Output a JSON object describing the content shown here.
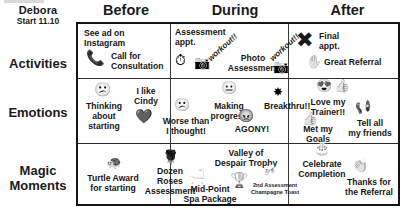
{
  "persona": {
    "name": "Debora",
    "start": "Start 11.10"
  },
  "columns": [
    {
      "id": "before",
      "label": "Before"
    },
    {
      "id": "during",
      "label": "During"
    },
    {
      "id": "after",
      "label": "After"
    }
  ],
  "rows": [
    {
      "id": "activities",
      "label": "Activities"
    },
    {
      "id": "emotions",
      "label": "Emotions"
    },
    {
      "id": "magic",
      "label": "Magic\nMoments"
    }
  ],
  "cells": {
    "activities_before": [
      {
        "text": "See ad on\nInstagram",
        "icon": ""
      },
      {
        "text": "Call for\nConsultation",
        "icon": "phone-icon"
      }
    ],
    "activities_during": [
      {
        "text": "Assessment\nappt.",
        "icon": "stopwatch-icon"
      },
      {
        "text": "workout!!",
        "icon": "camera-icon"
      },
      {
        "text": "Photo\nAssessment",
        "icon": ""
      },
      {
        "text": "workout!!",
        "icon": "camera-icon"
      }
    ],
    "activities_after": [
      {
        "text": "Final\nappt.",
        "icon": "x-mark-icon"
      },
      {
        "text": "Great Referral",
        "icon": "hand-ok-icon"
      }
    ],
    "emotions_before": [
      {
        "text": "Thinking\nabout\nstarting",
        "icon": "thinking-face-icon"
      },
      {
        "text": "I like\nCindy",
        "icon": "heart-icon"
      }
    ],
    "emotions_during": [
      {
        "text": "Worse than\nI thought!",
        "icon": "confused-face-icon"
      },
      {
        "text": "Making\nprogress",
        "icon": "neutral-face-icon"
      },
      {
        "text": "AGONY!",
        "icon": "angry-face-icon"
      },
      {
        "text": "Breakthru!!",
        "icon": "starburst-icon"
      }
    ],
    "emotions_after": [
      {
        "text": "Love my\nTrainer!!",
        "icon": "heart-eyes-face-icon"
      },
      {
        "text": "Met my\nGoals",
        "icon": "thumbs-up-icon"
      },
      {
        "text": "Tell all\nmy friends",
        "icon": "megaphone-icon"
      }
    ],
    "magic_before": [
      {
        "text": "Turtle Award\nfor starting",
        "icon": "turtle-icon"
      }
    ],
    "magic_during": [
      {
        "text": "Dozen Roses\nAssessment",
        "icon": "rose-icon"
      },
      {
        "text": "Mid-Point\nSpa Package",
        "icon": "bathtub-icon"
      },
      {
        "text": "Valley of\nDespair Trophy",
        "icon": "trophy-icon"
      },
      {
        "text": "2nd Assessment\nChampagne Toast",
        "icon": "champagne-glasses-icon"
      }
    ],
    "magic_after": [
      {
        "text": "Celebrate\nCompletion",
        "icon": "cake-icon"
      },
      {
        "text": "Thanks for\nthe Referral",
        "icon": "clapping-hands-icon"
      }
    ]
  },
  "labels": {
    "see_ad": "See ad on\nInstagram",
    "call_consult": "Call for\nConsultation",
    "assessment_appt": "Assessment\nappt.",
    "workout_1": "workout!!",
    "workout_2": "workout!!",
    "photo_assessment": "Photo\nAssessment",
    "final_appt": "Final\nappt.",
    "great_referral": "Great Referral",
    "thinking": "Thinking\nabout\nstarting",
    "i_like_cindy": "I like\nCindy",
    "worse_than": "Worse than\nI thought!",
    "making_progress": "Making\nprogress",
    "agony": "AGONY!",
    "breakthru": "Breakthru!!",
    "love_trainer": "Love my\nTrainer!!",
    "met_goals": "Met my\nGoals",
    "tell_friends": "Tell all\nmy friends",
    "turtle_award": "Turtle Award\nfor starting",
    "dozen_roses": "Dozen Roses\nAssessment",
    "mid_point_spa": "Mid-Point\nSpa Package",
    "valley_trophy": "Valley of\nDespair Trophy",
    "champagne": "2nd Assessment\nChampagne Toast",
    "celebrate": "Celebrate\nCompletion",
    "thanks_referral": "Thanks for\nthe Referral"
  },
  "colors": {
    "border": "#141414",
    "grid": "#3a3a3a",
    "text": "#161616",
    "page": "#ffffff"
  }
}
